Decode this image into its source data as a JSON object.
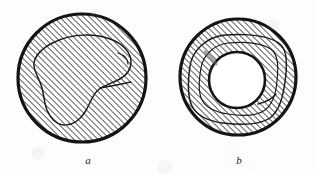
{
  "plate": {
    "title": "Two hatched circular cross-section diagrams",
    "description": "Scanned line illustration of two cross-sections filled with 45-degree hatching; each contains an irregular closed contour.",
    "background_color": "#fdfdfd",
    "ink_color": "#141414",
    "hatch_color": "#3a3a3a",
    "hatch_angle_degrees": 45,
    "hatch_spacing_px": 3
  },
  "figures": [
    {
      "id": "a",
      "caption": "a",
      "kind": "disc",
      "center_x": 82,
      "center_y": 78,
      "radius": 65,
      "outline_width": 3,
      "hatched": true,
      "inner_contour": "irregular kidney-shaped closed curve",
      "inner_contour_width": 1.4,
      "has_inner_hole": false
    },
    {
      "id": "b",
      "caption": "b",
      "kind": "annulus",
      "center_x": 238,
      "center_y": 77,
      "radius": 59,
      "inner_hole_center_x": 237,
      "inner_hole_center_y": 80,
      "inner_hole_radius": 28,
      "outline_width": 3,
      "hatched": true,
      "inner_contour": "rounded square closed curve surrounding the central hole",
      "inner_contour_width": 1.4,
      "has_inner_hole": true
    }
  ],
  "captions": {
    "figure_a_label": "a",
    "figure_b_label": "b"
  }
}
